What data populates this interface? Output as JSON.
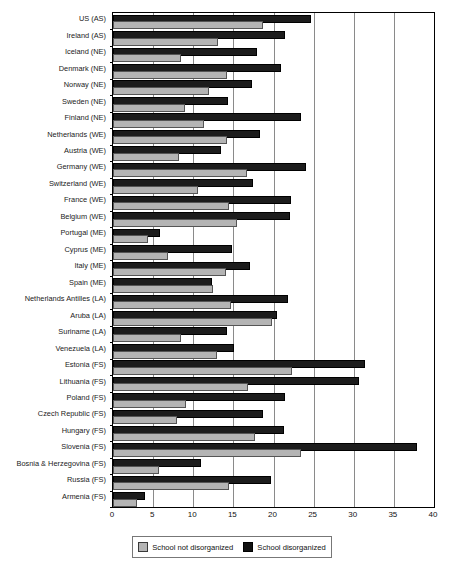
{
  "chart_data": {
    "type": "bar",
    "orientation": "horizontal",
    "title": "",
    "xlabel": "",
    "ylabel": "",
    "xlim": [
      0,
      40
    ],
    "xticks": [
      0,
      5,
      10,
      15,
      20,
      25,
      30,
      35,
      40
    ],
    "grid": true,
    "legend_position": "bottom",
    "categories": [
      "US (AS)",
      "Ireland (AS)",
      "Iceland (NE)",
      "Denmark (NE)",
      "Norway (NE)",
      "Sweden (NE)",
      "Finland (NE)",
      "Netherlands (WE)",
      "Austria (WE)",
      "Germany (WE)",
      "Switzerland (WE)",
      "France (WE)",
      "Belgium (WE)",
      "Portugal (ME)",
      "Cyprus (ME)",
      "Italy (ME)",
      "Spain (ME)",
      "Netherlands Antilles (LA)",
      "Aruba (LA)",
      "Suriname (LA)",
      "Venezuela (LA)",
      "Estonia (FS)",
      "Lithuania (FS)",
      "Poland (FS)",
      "Czech Republic (FS)",
      "Hungary (FS)",
      "Slovenia (FS)",
      "Bosnia & Herzegovina (FS)",
      "Russia (FS)",
      "Armenia (FS)"
    ],
    "series": [
      {
        "name": "School disorganized",
        "color": "#1c1c1c",
        "values": [
          24.4,
          21.2,
          17.7,
          20.7,
          17.1,
          14.1,
          23.2,
          18.1,
          13.2,
          23.8,
          17.2,
          21.9,
          21.8,
          5.6,
          14.6,
          16.8,
          12.1,
          21.6,
          20.2,
          13.9,
          14.8,
          31.1,
          30.4,
          21.2,
          18.5,
          21.0,
          37.6,
          10.7,
          19.5,
          3.7
        ]
      },
      {
        "name": "School not disorganized",
        "color": "#b4b4b4",
        "values": [
          18.4,
          12.8,
          8.2,
          13.9,
          11.7,
          8.7,
          11.1,
          13.9,
          8.0,
          16.5,
          10.3,
          14.2,
          15.2,
          4.1,
          6.6,
          13.8,
          12.2,
          14.4,
          19.6,
          8.2,
          12.7,
          22.0,
          16.6,
          8.9,
          7.7,
          17.5,
          23.2,
          5.5,
          14.2,
          2.8
        ]
      }
    ]
  },
  "legend": {
    "items": [
      {
        "label": "School not disorganized",
        "swatch": "light"
      },
      {
        "label": "School disorganized",
        "swatch": "dark"
      }
    ]
  }
}
